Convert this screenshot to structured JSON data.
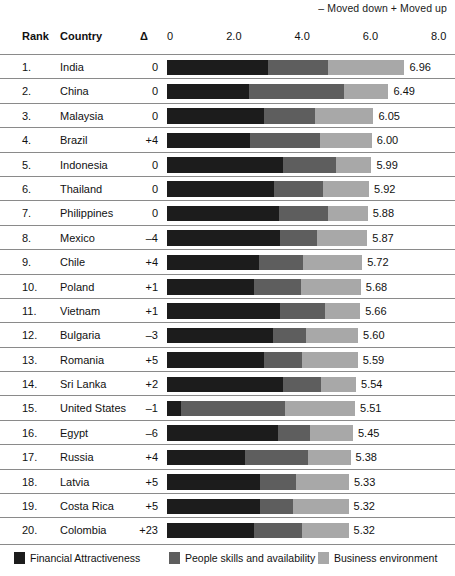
{
  "header": {
    "note": "– Moved down + Moved up",
    "rank_label": "Rank",
    "country_label": "Country",
    "delta_label": "Δ"
  },
  "chart_data": {
    "type": "bar",
    "title": "",
    "xlabel": "",
    "ylabel": "",
    "stacked": true,
    "orientation": "horizontal",
    "xlim": [
      0,
      8
    ],
    "grid": false,
    "legend_position": "bottom",
    "axis_ticks": [
      "0",
      "2.0",
      "4.0",
      "6.0",
      "8.0"
    ],
    "axis_tick_values": [
      0,
      2,
      4,
      6,
      8
    ],
    "series": [
      {
        "name": "Financial Attractiveness",
        "color": "#1c1c1c",
        "values": [
          2.95,
          2.4,
          2.85,
          2.42,
          3.4,
          3.15,
          3.27,
          3.3,
          2.7,
          2.55,
          3.3,
          3.12,
          2.85,
          3.4,
          0.4,
          3.25,
          2.28,
          2.72,
          2.72,
          2.55
        ]
      },
      {
        "name": "People skills and availability",
        "color": "#5e5e5e",
        "values": [
          1.78,
          2.78,
          1.48,
          2.06,
          1.55,
          1.42,
          1.45,
          1.1,
          1.28,
          1.37,
          1.33,
          0.95,
          1.12,
          1.12,
          3.05,
          0.95,
          1.85,
          1.05,
          0.98,
          1.42
        ]
      },
      {
        "name": "Business environment",
        "color": "#a8a8a8",
        "values": [
          2.23,
          1.31,
          1.72,
          1.52,
          1.04,
          1.35,
          1.16,
          1.47,
          1.74,
          1.76,
          1.03,
          1.53,
          1.62,
          1.02,
          2.06,
          1.25,
          1.25,
          1.56,
          1.62,
          1.35
        ]
      }
    ],
    "rows": [
      {
        "rank": "1.",
        "country": "India",
        "delta": "0",
        "value": "6.96",
        "total": 6.96
      },
      {
        "rank": "2.",
        "country": "China",
        "delta": "0",
        "value": "6.49",
        "total": 6.49
      },
      {
        "rank": "3.",
        "country": "Malaysia",
        "delta": "0",
        "value": "6.05",
        "total": 6.05
      },
      {
        "rank": "4.",
        "country": "Brazil",
        "delta": "+4",
        "value": "6.00",
        "total": 6.0
      },
      {
        "rank": "5.",
        "country": "Indonesia",
        "delta": "0",
        "value": "5.99",
        "total": 5.99
      },
      {
        "rank": "6.",
        "country": "Thailand",
        "delta": "0",
        "value": "5.92",
        "total": 5.92
      },
      {
        "rank": "7.",
        "country": "Philippines",
        "delta": "0",
        "value": "5.88",
        "total": 5.88
      },
      {
        "rank": "8.",
        "country": "Mexico",
        "delta": "–4",
        "value": "5.87",
        "total": 5.87
      },
      {
        "rank": "9.",
        "country": "Chile",
        "delta": "+4",
        "value": "5.72",
        "total": 5.72
      },
      {
        "rank": "10.",
        "country": "Poland",
        "delta": "+1",
        "value": "5.68",
        "total": 5.68
      },
      {
        "rank": "11.",
        "country": "Vietnam",
        "delta": "+1",
        "value": "5.66",
        "total": 5.66
      },
      {
        "rank": "12.",
        "country": "Bulgaria",
        "delta": "–3",
        "value": "5.60",
        "total": 5.6
      },
      {
        "rank": "13.",
        "country": "Romania",
        "delta": "+5",
        "value": "5.59",
        "total": 5.59
      },
      {
        "rank": "14.",
        "country": "Sri Lanka",
        "delta": "+2",
        "value": "5.54",
        "total": 5.54
      },
      {
        "rank": "15.",
        "country": "United States",
        "delta": "–1",
        "value": "5.51",
        "total": 5.51
      },
      {
        "rank": "16.",
        "country": "Egypt",
        "delta": "–6",
        "value": "5.45",
        "total": 5.45
      },
      {
        "rank": "17.",
        "country": "Russia",
        "delta": "+4",
        "value": "5.38",
        "total": 5.38
      },
      {
        "rank": "18.",
        "country": "Latvia",
        "delta": "+5",
        "value": "5.33",
        "total": 5.33
      },
      {
        "rank": "19.",
        "country": "Costa Rica",
        "delta": "+5",
        "value": "5.32",
        "total": 5.32
      },
      {
        "rank": "20.",
        "country": "Colombia",
        "delta": "+23",
        "value": "5.32",
        "total": 5.32
      }
    ]
  },
  "legend": [
    {
      "label": "Financial Attractiveness",
      "color": "#1c1c1c"
    },
    {
      "label": "People skills and availability",
      "color": "#5e5e5e"
    },
    {
      "label": "Business environment",
      "color": "#a8a8a8"
    }
  ]
}
